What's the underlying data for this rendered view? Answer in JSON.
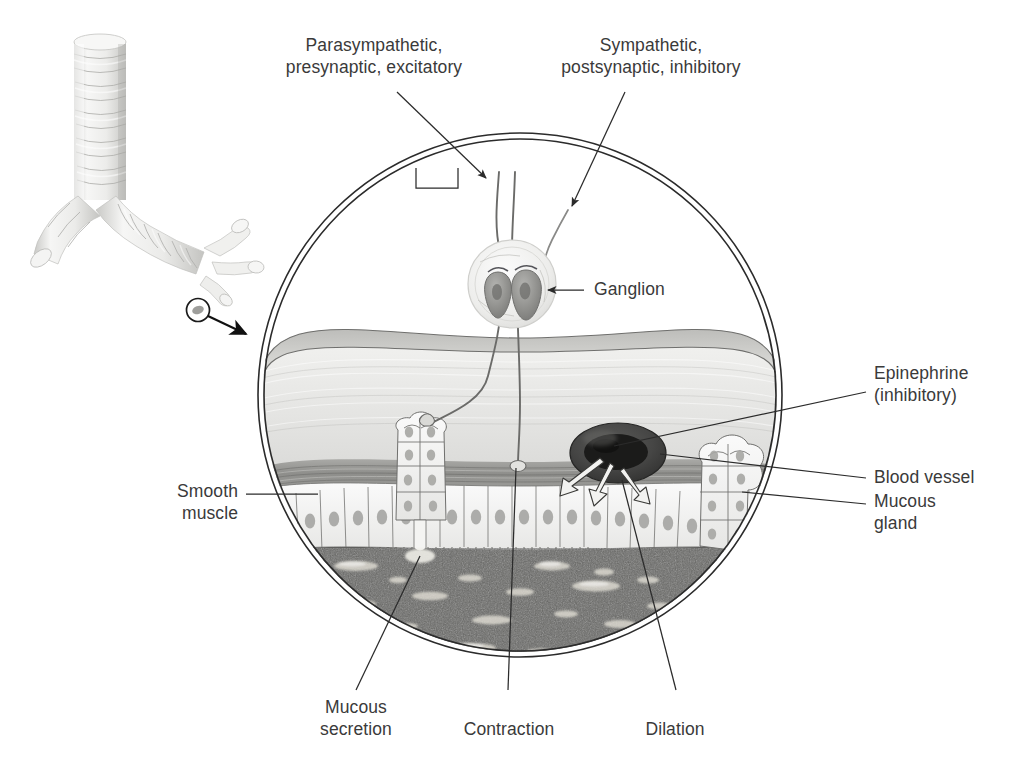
{
  "figure": {
    "background_color": "#ffffff",
    "text_color": "#3a3a3a",
    "line_color": "#2b2b2b"
  },
  "labels": {
    "parasympathetic": "Parasympathetic,\npresynaptic, excitatory",
    "sympathetic": "Sympathetic,\npostsynaptic, inhibitory",
    "ganglion": "Ganglion",
    "epinephrine": "Epinephrine\n(inhibitory)",
    "blood_vessel": "Blood vessel",
    "mucous_gland": "Mucous\ngland",
    "smooth_muscle": "Smooth\nmuscle",
    "mucous_secretion": "Mucous\nsecretion",
    "contraction": "Contraction",
    "dilation": "Dilation"
  },
  "structures": {
    "airway_inset": "bronchial-tree-inset",
    "magnifier_circle": "magnified-bronchiole-circle",
    "ganglion_neurons": 2,
    "epithelium": "ciliated-columnar-epithelium",
    "lumen": "airway-lumen-with-mucus",
    "vessel": "blood-vessel-cross-section",
    "glands": [
      "mucous-gland-left",
      "mucous-gland-right"
    ]
  },
  "colors": {
    "tissue_pale": "#e8e8e6",
    "muscle_gray": "#9a9a98",
    "lumen_dark": "#5d5d5b",
    "vessel_dark": "#3c3c3c",
    "cartilage_light": "#efefed"
  }
}
